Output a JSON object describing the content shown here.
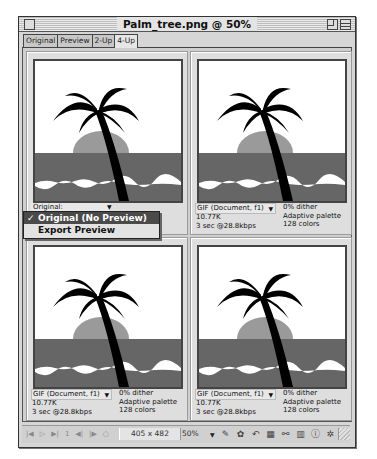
{
  "window": {
    "title": "Palm_tree.png @ 50%"
  },
  "tabs": [
    {
      "label": "Original",
      "active": false
    },
    {
      "label": "Preview",
      "active": false
    },
    {
      "label": "2-Up",
      "active": false
    },
    {
      "label": "4-Up",
      "active": true
    }
  ],
  "panes": [
    {
      "id": "original",
      "label": "Original:",
      "menu": {
        "items": [
          {
            "label": "Original (No Preview)",
            "checked": true,
            "highlighted": true
          },
          {
            "label": "Export Preview",
            "checked": false,
            "highlighted": false
          }
        ]
      }
    },
    {
      "id": "optimized-1",
      "format": "GIF (Document, f1)",
      "size": "10.77K",
      "download_time": "3 sec @28.8kbps",
      "dither": "0% dither",
      "palette": "Adaptive palette",
      "colors": "128 colors"
    },
    {
      "id": "optimized-2",
      "format": "GIF (Document, f1)",
      "size": "10.77K",
      "download_time": "3 sec @28.8kbps",
      "dither": "0% dither",
      "palette": "Adaptive palette",
      "colors": "128 colors"
    },
    {
      "id": "optimized-3",
      "format": "GIF (Document, f1)",
      "size": "10.77K",
      "download_time": "3 sec @28.8kbps",
      "dither": "0% dither",
      "palette": "Adaptive palette",
      "colors": "128 colors"
    }
  ],
  "statusbar": {
    "nav_icons": [
      "first-frame-icon",
      "play-icon",
      "last-frame-icon",
      "frame-number",
      "prev-frame-icon",
      "next-frame-icon",
      "loop-icon"
    ],
    "frame_number": "1",
    "dimensions": "405 x 482",
    "zoom": "50%",
    "tools": [
      "pencil-icon",
      "palette-icon",
      "undo-icon",
      "export-icon",
      "hyperlink-icon",
      "book-icon",
      "info-icon",
      "settings-icon"
    ]
  },
  "icons": {
    "check": "✓",
    "dropdown_arrow": "▼"
  },
  "colors": {
    "window_bg": "#d6d6d6",
    "sea": "#666666",
    "sun": "#999999",
    "tree": "#000000",
    "menu_highlight": "#4a4a4a"
  }
}
